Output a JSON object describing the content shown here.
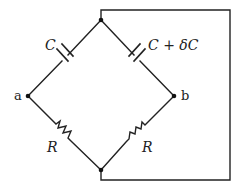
{
  "diagram": {
    "type": "capacitance bridge circuit",
    "nodes": {
      "a": {
        "label": "a"
      },
      "b": {
        "label": "b"
      }
    },
    "components": {
      "cap_left": {
        "label": "C"
      },
      "cap_right": {
        "label_main": "C",
        "label_op": " + ",
        "label_delta": "δC"
      },
      "res_left": {
        "label": "R"
      },
      "res_right": {
        "label": "R"
      }
    },
    "colors": {
      "line": "#222222",
      "background": "#ffffff"
    }
  }
}
